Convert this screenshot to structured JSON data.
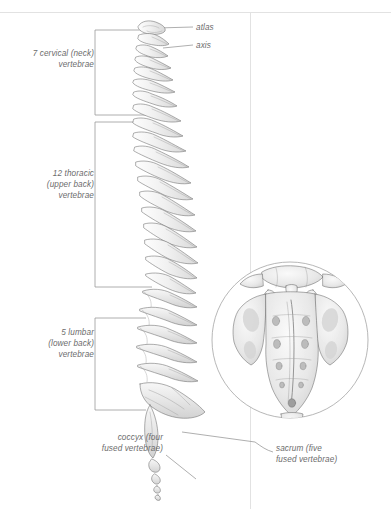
{
  "figure": {
    "background_color": "#ffffff",
    "ink_color": "#555555",
    "label_color": "#6c6c6c",
    "bone_fill": "#efefef"
  },
  "labels": {
    "atlas": "atlas",
    "axis": "axis",
    "cervical": "7 cervical (neck)\nvertebrae",
    "thoracic": "12 thoracic\n(upper back)\nvertebrae",
    "lumbar": "5 lumbar\n(lower back)\nvertebrae",
    "coccyx": "coccyx (four\nfused vertebrae)",
    "sacrum": "sacrum (five\nfused vertebrae)"
  },
  "regions": [
    {
      "name": "cervical",
      "count": 7,
      "common_name": "neck",
      "bracket_top": 30,
      "bracket_bottom": 115
    },
    {
      "name": "thoracic",
      "count": 12,
      "common_name": "upper back",
      "bracket_top": 122,
      "bracket_bottom": 287
    },
    {
      "name": "lumbar",
      "count": 5,
      "common_name": "lower back",
      "bracket_top": 318,
      "bracket_bottom": 410
    },
    {
      "name": "sacrum",
      "count": 5,
      "common_name": "fused vertebrae"
    },
    {
      "name": "coccyx",
      "count": 4,
      "common_name": "fused vertebrae"
    }
  ],
  "inset": {
    "name": "sacrum-posterior-view",
    "shape": "circle",
    "center_x": 290,
    "center_y": 340,
    "radius": 78
  },
  "rules": {
    "top_rule_y": 12,
    "divider_x": 250
  }
}
